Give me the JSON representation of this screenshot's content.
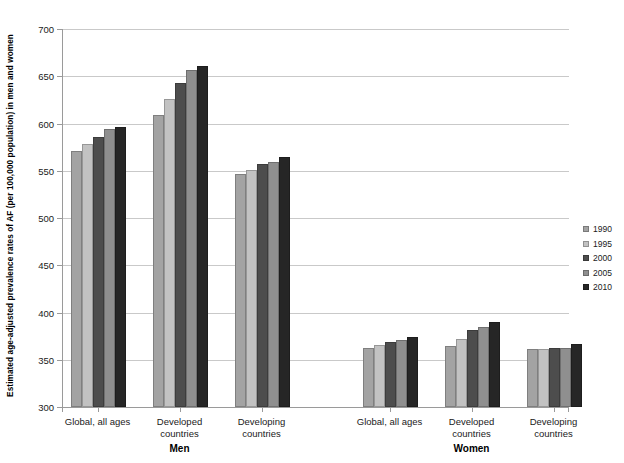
{
  "chart_data": {
    "type": "bar",
    "title": "",
    "xlabel": "",
    "ylabel": "Estimated age-adjusted prevalence rates of AF (per 100,000 population) in men and women",
    "ylim": [
      300,
      700
    ],
    "ytick_values": [
      300,
      350,
      400,
      450,
      500,
      550,
      600,
      650,
      700
    ],
    "ytick_labels": [
      "300",
      "350",
      "400",
      "450",
      "500",
      "550",
      "600",
      "650",
      "700"
    ],
    "grid": true,
    "legend_position": "right",
    "legend_title": "",
    "series": [
      {
        "name": "1990",
        "color": "#a3a3a3",
        "values": [
          571,
          609,
          547,
          362,
          365,
          361
        ]
      },
      {
        "name": "1995",
        "color": "#c2c2c2",
        "values": [
          578,
          626,
          551,
          366,
          372,
          361
        ]
      },
      {
        "name": "2000",
        "color": "#4d4d4d",
        "values": [
          586,
          643,
          557,
          369,
          381,
          362
        ]
      },
      {
        "name": "2005",
        "color": "#8f8f8f",
        "values": [
          594,
          657,
          559,
          371,
          385,
          362
        ]
      },
      {
        "name": "2010",
        "color": "#262626",
        "values": [
          596,
          661,
          565,
          374,
          390,
          367
        ]
      }
    ],
    "panels": [
      {
        "label": "Men",
        "categories": [
          "Global, all ages",
          "Developed\ncountries",
          "Developing\ncountries"
        ]
      },
      {
        "label": "Women",
        "categories": [
          "Global, all ages",
          "Developed\ncountries",
          "Developing\ncountries"
        ]
      }
    ]
  },
  "legend": {
    "items": [
      {
        "label": "1990",
        "color": "#a3a3a3"
      },
      {
        "label": "1995",
        "color": "#c2c2c2"
      },
      {
        "label": "2000",
        "color": "#4d4d4d"
      },
      {
        "label": "2005",
        "color": "#8f8f8f"
      },
      {
        "label": "2010",
        "color": "#262626"
      }
    ]
  },
  "axis": {
    "y_title": "Estimated age-adjusted prevalence rates of AF (per 100,000 population) in men and women"
  }
}
